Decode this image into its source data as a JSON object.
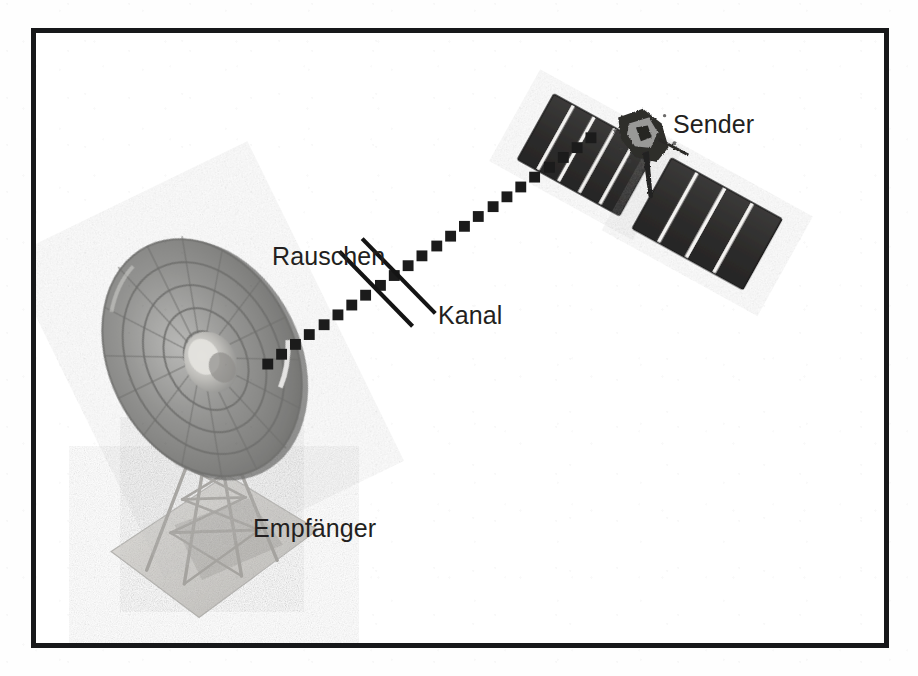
{
  "figure": {
    "kind": "communication-system-diagram",
    "language": "de",
    "frame": {
      "border_color": "#17181a",
      "border_width_px": 5,
      "background_color": "#ffffff"
    },
    "labels": [
      {
        "id": "sender",
        "text": "Sender",
        "x": 637,
        "y": 79,
        "describes": "satellite-transmitter"
      },
      {
        "id": "rauschen",
        "text": "Rauschen",
        "x": 236,
        "y": 211,
        "describes": "noise-injection-marks"
      },
      {
        "id": "kanal",
        "text": "Kanal",
        "x": 402,
        "y": 270,
        "describes": "dotted-signal-path"
      },
      {
        "id": "empfaenger",
        "text": "Empfänger",
        "x": 217,
        "y": 483,
        "describes": "ground-station-dish"
      }
    ],
    "elements": {
      "satellite": {
        "name": "satellite-transmitter",
        "panel_count": 2,
        "upper_panel_cells": 5,
        "lower_panel_cells": 4,
        "panel_color": "#30302f",
        "divider_color": "#f2f2f0",
        "body_color": "#2d2c2b"
      },
      "dish": {
        "name": "ground-station-dish",
        "ring_count": 5,
        "dish_color": "#8d8d8d",
        "tower_color": "#b3b2ae",
        "pad_color": "#cfcecb"
      },
      "channel": {
        "name": "dotted-signal-path",
        "marker": "square",
        "marker_count": 24,
        "marker_size_px": 11,
        "color": "#1b1b1b",
        "start": {
          "x": 266,
          "y": 365
        },
        "end": {
          "x": 594,
          "y": 134
        }
      },
      "noise": {
        "name": "noise-injection-marks",
        "stroke_count": 2,
        "color": "#141414",
        "stroke_width_px": 4,
        "angle_deg": 45
      }
    },
    "colors": {
      "ink": "#231f20",
      "frame": "#17181a",
      "paper": "#ffffff",
      "dark_panel": "#30302f",
      "metal_gray": "#8d8d8d"
    }
  }
}
